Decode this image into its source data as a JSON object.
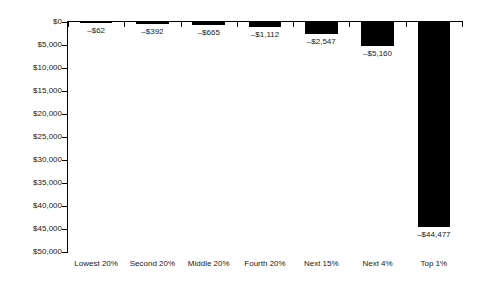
{
  "chart_data": {
    "type": "bar",
    "title": "",
    "subtitle": "",
    "xlabel": "",
    "ylabel": "",
    "categories": [
      "Lowest 20%",
      "Second 20%",
      "Middle 20%",
      "Fourth 20%",
      "Next 15%",
      "Next 4%",
      "Top 1%"
    ],
    "values": [
      -62,
      -392,
      -665,
      -1112,
      -2547,
      -5160,
      -44477
    ],
    "data_labels": [
      "–$62",
      "–$392",
      "–$665",
      "–$1,112",
      "–$2,547",
      "–$5,160",
      "–$44,477"
    ],
    "ylim": [
      0,
      -50000
    ],
    "y_axis_inverted": true,
    "ytick_values": [
      0,
      -5000,
      -10000,
      -15000,
      -20000,
      -25000,
      -30000,
      -35000,
      -40000,
      -45000,
      -50000
    ],
    "ytick_labels": [
      "$0",
      "$5,000",
      "$10,000",
      "$15,000",
      "$20,000",
      "$25,000",
      "$30,000",
      "$35,000",
      "$40,000",
      "$45,000",
      "$50,000"
    ],
    "grid": false,
    "legend": null,
    "legend_position": "none",
    "bar_color": "#000000",
    "background_color": "#ffffff",
    "axis_color": "#000000",
    "text_color": "#1a1a1a",
    "annotations": []
  }
}
